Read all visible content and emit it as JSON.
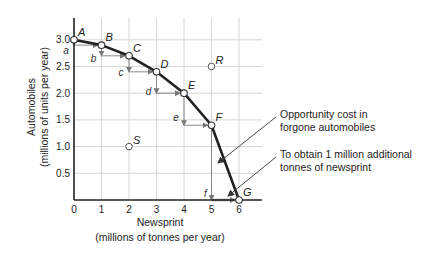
{
  "chart_data": {
    "type": "line",
    "title": "",
    "xlabel": "Newsprint",
    "xlabel_sub": "(millions of tonnes per year)",
    "ylabel": "Automobiles",
    "ylabel_sub": "(millions of units per year)",
    "xlim": [
      0,
      6.85
    ],
    "ylim": [
      0,
      3.4
    ],
    "x_ticks": [
      "0",
      "1",
      "2",
      "3",
      "4",
      "5",
      "6"
    ],
    "y_ticks": [
      "0.5",
      "1.0",
      "1.5",
      "2.0",
      "2.5",
      "3.0"
    ],
    "grid": true,
    "series": [
      {
        "name": "Production possibility boundary",
        "points": [
          {
            "label": "A",
            "x": 0,
            "y": 3.0
          },
          {
            "label": "B",
            "x": 1,
            "y": 2.9
          },
          {
            "label": "C",
            "x": 2,
            "y": 2.7
          },
          {
            "label": "D",
            "x": 3,
            "y": 2.4
          },
          {
            "label": "E",
            "x": 4,
            "y": 2.0
          },
          {
            "label": "F",
            "x": 5,
            "y": 1.4
          },
          {
            "label": "G",
            "x": 6,
            "y": 0.0
          }
        ]
      }
    ],
    "other_points": [
      {
        "label": "R",
        "x": 5,
        "y": 2.5
      },
      {
        "label": "S",
        "x": 2,
        "y": 1.0
      }
    ],
    "step_labels": [
      "a",
      "b",
      "c",
      "d",
      "e",
      "f"
    ],
    "annotations": [
      {
        "id": "opportunity",
        "line1": "Opportunity cost in",
        "line2": "forgone automobiles"
      },
      {
        "id": "obtain",
        "line1": "To obtain 1 million additional",
        "line2": "tonnes of newsprint"
      }
    ]
  }
}
